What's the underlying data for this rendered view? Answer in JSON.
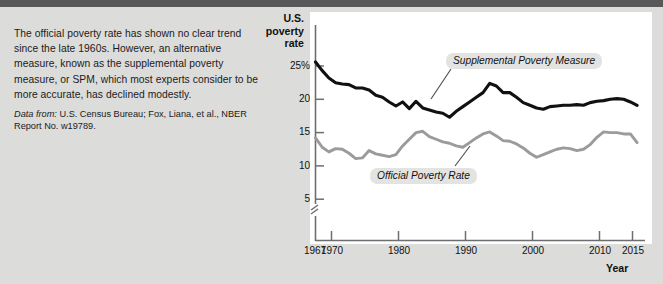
{
  "caption": {
    "body": "The official poverty rate has shown no clear trend since the late 1960s. However, an alternative measure, known as the supplemental poverty measure, or SPM, which most experts consider to be more accurate, has declined modestly.",
    "source_label": "Data from:",
    "source_text": " U.S. Census Bureau; Fox, Liana, et al., NBER Report No. w19789."
  },
  "chart_data": {
    "type": "line",
    "title": "",
    "ylabel": "U.S. poverty rate",
    "xlabel": "Year",
    "xlim": [
      1967,
      2015
    ],
    "ylim": [
      3.5,
      27
    ],
    "grid": false,
    "axis_break": true,
    "y_ticks": [
      {
        "value": 25,
        "label": "25%"
      },
      {
        "value": 20,
        "label": "20"
      },
      {
        "value": 15,
        "label": "15"
      },
      {
        "value": 10,
        "label": "10"
      },
      {
        "value": 5,
        "label": "5"
      }
    ],
    "x_ticks": [
      {
        "value": 1967,
        "label": "1967"
      },
      {
        "value": 1970,
        "label": "1970"
      },
      {
        "value": 1980,
        "label": "1980"
      },
      {
        "value": 1990,
        "label": "1990"
      },
      {
        "value": 2000,
        "label": "2000"
      },
      {
        "value": 2010,
        "label": "2010"
      },
      {
        "value": 2015,
        "label": "2015"
      }
    ],
    "x": [
      1967,
      1968,
      1969,
      1970,
      1971,
      1972,
      1973,
      1974,
      1975,
      1976,
      1977,
      1978,
      1979,
      1980,
      1981,
      1982,
      1983,
      1984,
      1985,
      1986,
      1987,
      1988,
      1989,
      1990,
      1991,
      1992,
      1993,
      1994,
      1995,
      1996,
      1997,
      1998,
      1999,
      2000,
      2001,
      2002,
      2003,
      2004,
      2005,
      2006,
      2007,
      2008,
      2009,
      2010,
      2011,
      2012,
      2013,
      2014,
      2015
    ],
    "series": [
      {
        "name": "Supplemental Poverty Measure",
        "color": "#111111",
        "values": [
          25.6,
          24.3,
          23.2,
          22.5,
          22.3,
          22.2,
          21.7,
          21.7,
          21.4,
          20.6,
          20.3,
          19.6,
          19.0,
          19.6,
          18.6,
          19.7,
          18.7,
          18.4,
          18.1,
          17.9,
          17.3,
          18.2,
          18.9,
          19.6,
          20.3,
          21.0,
          22.4,
          22.0,
          21.0,
          21.0,
          20.3,
          19.5,
          19.1,
          18.7,
          18.5,
          18.9,
          19.0,
          19.1,
          19.1,
          19.2,
          19.1,
          19.5,
          19.7,
          19.8,
          20.0,
          20.1,
          20.0,
          19.6,
          19.1
        ]
      },
      {
        "name": "Official Poverty Rate",
        "color": "#9b9b9b",
        "values": [
          14.2,
          12.8,
          12.1,
          12.6,
          12.5,
          11.9,
          11.1,
          11.2,
          12.3,
          11.8,
          11.6,
          11.4,
          11.7,
          13.0,
          14.0,
          15.0,
          15.2,
          14.4,
          14.0,
          13.6,
          13.4,
          13.0,
          12.8,
          13.5,
          14.2,
          14.8,
          15.1,
          14.5,
          13.8,
          13.7,
          13.3,
          12.7,
          11.9,
          11.3,
          11.7,
          12.1,
          12.5,
          12.7,
          12.6,
          12.3,
          12.5,
          13.2,
          14.3,
          15.1,
          15.0,
          15.0,
          14.8,
          14.8,
          13.5
        ]
      }
    ],
    "annotations": [
      {
        "name": "spm-label",
        "text": "Supplemental Poverty Measure"
      },
      {
        "name": "official-label",
        "text": "Official Poverty Rate"
      }
    ]
  }
}
